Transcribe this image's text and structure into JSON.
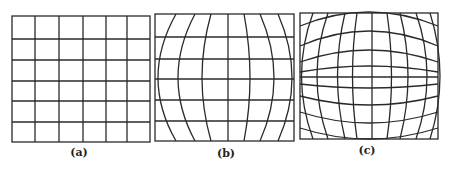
{
  "figure": {
    "panels": [
      {
        "id": "a",
        "caption": "(a)",
        "description": "regular undistorted grid",
        "columns": 6,
        "rows": 6
      },
      {
        "id": "b",
        "caption": "(b)",
        "description": "grid with barrel-curved vertical lines",
        "columns": 6,
        "rows": 6
      },
      {
        "id": "c",
        "caption": "(c)",
        "description": "grid with barrel-curved vertical and horizontal lines",
        "columns": 8,
        "rows": 8
      }
    ],
    "line_color": "#2a2a2a",
    "background": "#ffffff"
  }
}
